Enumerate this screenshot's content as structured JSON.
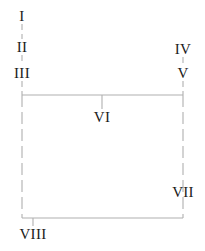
{
  "diagram": {
    "type": "flow-diagram",
    "background_color": "#ffffff",
    "line_color": "#b0b0b0",
    "text_color": "#1a1a1a",
    "nodes": [
      {
        "id": "n1",
        "label": "I",
        "x": 22,
        "y": 16
      },
      {
        "id": "n2",
        "label": "II",
        "x": 22,
        "y": 47
      },
      {
        "id": "n3",
        "label": "III",
        "x": 22,
        "y": 73
      },
      {
        "id": "n4",
        "label": "IV",
        "x": 183,
        "y": 49
      },
      {
        "id": "n5",
        "label": "V",
        "x": 183,
        "y": 73
      },
      {
        "id": "n6",
        "label": "VI",
        "x": 102,
        "y": 117
      },
      {
        "id": "n7",
        "label": "VII",
        "x": 183,
        "y": 192
      },
      {
        "id": "n8",
        "label": "VIII",
        "x": 33,
        "y": 234
      }
    ],
    "edges": [
      {
        "id": "e1",
        "from": "I",
        "to": "II",
        "style": "dashed",
        "x1": 22,
        "y1": 24,
        "x2": 22,
        "y2": 39
      },
      {
        "id": "e2",
        "from": "II",
        "to": "III",
        "style": "dashed",
        "x1": 22,
        "y1": 55,
        "x2": 22,
        "y2": 65
      },
      {
        "id": "e3",
        "from": "IV",
        "to": "V",
        "style": "dashed",
        "x1": 183,
        "y1": 57,
        "x2": 183,
        "y2": 65
      },
      {
        "id": "e4",
        "from": "III",
        "to": "rail-left",
        "style": "dashed",
        "x1": 22,
        "y1": 81,
        "x2": 22,
        "y2": 95
      },
      {
        "id": "e5",
        "from": "V",
        "to": "rail-right",
        "style": "dashed",
        "x1": 183,
        "y1": 81,
        "x2": 183,
        "y2": 95
      },
      {
        "id": "e6",
        "from": "rail-left",
        "to": "rail-right",
        "style": "solid",
        "x1": 22,
        "y1": 95,
        "x2": 183,
        "y2": 95
      },
      {
        "id": "e7",
        "from": "rail-mid",
        "to": "VI",
        "style": "solid",
        "x1": 102,
        "y1": 95,
        "x2": 102,
        "y2": 109
      },
      {
        "id": "e8",
        "from": "rail-left",
        "to": "bottom-left",
        "style": "dashed",
        "x1": 22,
        "y1": 95,
        "x2": 22,
        "y2": 218
      },
      {
        "id": "e9",
        "from": "rail-right",
        "to": "bottom-right",
        "style": "dashed",
        "x1": 183,
        "y1": 95,
        "x2": 183,
        "y2": 218
      },
      {
        "id": "e10",
        "from": "bottom-left",
        "to": "bottom-right",
        "style": "solid",
        "x1": 22,
        "y1": 218,
        "x2": 183,
        "y2": 218
      },
      {
        "id": "e11",
        "from": "bottom-rail",
        "to": "VIII",
        "style": "solid",
        "x1": 33,
        "y1": 218,
        "x2": 33,
        "y2": 226
      }
    ]
  }
}
